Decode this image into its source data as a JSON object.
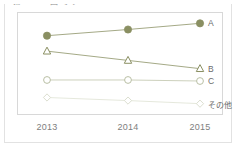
{
  "card": {
    "title": "第1-4-3-2図 その1"
  },
  "chart_data": {
    "type": "line",
    "title": "第1-4-3-2図 その1",
    "xlabel": "",
    "ylabel": "",
    "categories": [
      "2013",
      "2014",
      "2015"
    ],
    "x_tick_labels": [
      "2013",
      "2014",
      "2015"
    ],
    "ylim": [
      0,
      100
    ],
    "grid": false,
    "legend_position": "right-of-last-point",
    "series": [
      {
        "name": "A",
        "label": "A",
        "marker": "filled-circle",
        "color": "#8a8f62",
        "line_color": "#9a9f78",
        "fill": "#8a8f62",
        "values": [
          77,
          83,
          89
        ]
      },
      {
        "name": "B",
        "label": "B",
        "marker": "open-triangle",
        "color": "#8a8f62",
        "line_color": "#9a9f78",
        "fill": "#ffffff",
        "values": [
          62,
          53,
          45
        ]
      },
      {
        "name": "C",
        "label": "C",
        "marker": "open-circle",
        "color": "#b9bfa4",
        "line_color": "#c6cbb4",
        "fill": "#ffffff",
        "values": [
          34,
          34,
          33
        ]
      },
      {
        "name": "その他",
        "label": "その他",
        "marker": "open-diamond",
        "color": "#dcdfd0",
        "line_color": "#e2e5d8",
        "fill": "#ffffff",
        "values": [
          17,
          14,
          11
        ]
      }
    ]
  }
}
